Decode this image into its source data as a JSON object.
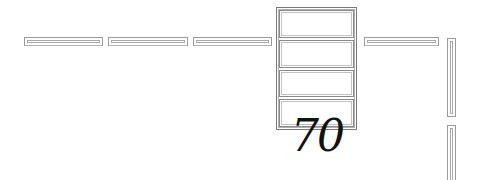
{
  "colors": {
    "outline": "#9a9a9a",
    "inner_outline": "#a8a8a8",
    "text": "#111111",
    "background": "#ffffff"
  },
  "horizontal_bars": [
    {
      "x": 24,
      "y": 37,
      "w": 79
    },
    {
      "x": 108,
      "y": 37,
      "w": 80
    },
    {
      "x": 193,
      "y": 37,
      "w": 79
    },
    {
      "x": 364,
      "y": 37,
      "w": 75
    }
  ],
  "vertical_bars": [
    {
      "x": 447,
      "y": 38,
      "h": 79
    },
    {
      "x": 447,
      "y": 125,
      "h": 60
    }
  ],
  "stack": {
    "cells": 4
  },
  "label": {
    "text": "70"
  }
}
